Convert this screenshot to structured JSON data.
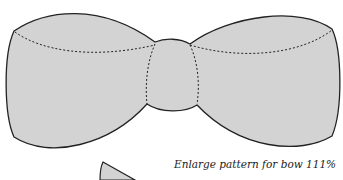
{
  "figure": {
    "fill_color": "#d3d3d3",
    "outline_color": "#222222",
    "fold_line_style": "dotted"
  },
  "caption": {
    "line1": "Enlarge pattern for bow 111%",
    "line2": "· ·"
  }
}
